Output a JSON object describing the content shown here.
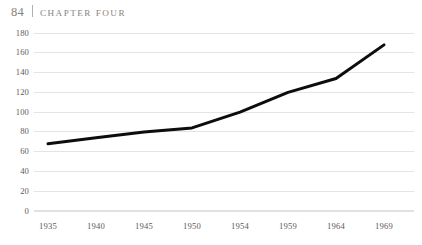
{
  "running_head": {
    "folio": "84",
    "separator": "|",
    "chapter": "CHAPTER FOUR"
  },
  "chart_data": {
    "type": "line",
    "title": "",
    "subtitle": "",
    "xlabel": "",
    "ylabel": "",
    "categories": [
      "1935",
      "1940",
      "1945",
      "1950",
      "1954",
      "1959",
      "1964",
      "1969"
    ],
    "values": [
      68,
      74,
      80,
      84,
      100,
      120,
      134,
      168
    ],
    "series": [
      {
        "name": "",
        "values": [
          68,
          74,
          80,
          84,
          100,
          120,
          134,
          168
        ]
      }
    ],
    "ylim": [
      0,
      180
    ],
    "y_ticks": [
      0,
      20,
      40,
      60,
      80,
      100,
      120,
      140,
      160,
      180
    ],
    "y_tick_labels": [
      "0",
      "20",
      "40",
      "60",
      "80",
      "100",
      "120",
      "140",
      "160",
      "180"
    ],
    "x_tick_labels": [
      "1935",
      "1940",
      "1945",
      "1950",
      "1954",
      "1959",
      "1964",
      "1969"
    ],
    "grid": true,
    "grid_axis": "y",
    "legend": false,
    "legend_position": "none",
    "markers": false,
    "line_color": "#0d0d0d",
    "line_width": 3,
    "grid_color": "#e3e1de",
    "tick_label_color": "#5d5a57",
    "background_color": "#ffffff"
  },
  "layout": {
    "plot_left": 34,
    "plot_right": 414,
    "plot_top": 33,
    "plot_bottom": 211,
    "x_positions": [
      48,
      96,
      144,
      192,
      240,
      288,
      336,
      384
    ]
  }
}
